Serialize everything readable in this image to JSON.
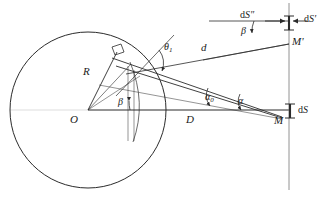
{
  "figure": {
    "type": "geometry-diagram",
    "stroke_color": "#2b2b2b",
    "background": "#ffffff"
  },
  "points": {
    "center": {
      "label": "O",
      "x": 88,
      "y": 110
    },
    "observer": {
      "label": "M",
      "x": 281,
      "y": 118
    },
    "observer_upper": {
      "label": "M'",
      "x": 292,
      "y": 45
    }
  },
  "segments": {
    "radius": {
      "label": "R"
    },
    "distance_axis": {
      "label": "D"
    },
    "slant": {
      "label": "d"
    }
  },
  "angles": {
    "theta1": {
      "label": "θ",
      "sub": "1"
    },
    "alpha0": {
      "label": "α",
      "sub": "0"
    },
    "alpha": {
      "label": "α",
      "sub": ""
    },
    "beta_center": {
      "label": "β",
      "sub": ""
    },
    "beta_upper": {
      "label": "β",
      "sub": ""
    }
  },
  "elements": {
    "dS": {
      "prefix": "d",
      "symbol": "S",
      "prime": ""
    },
    "dS_prime": {
      "prefix": "d",
      "symbol": "S",
      "prime": "′"
    },
    "dS_double_prime": {
      "prefix": "d",
      "symbol": "S",
      "prime": "″"
    }
  },
  "markers": {
    "right_angle": "right-angle-square"
  }
}
